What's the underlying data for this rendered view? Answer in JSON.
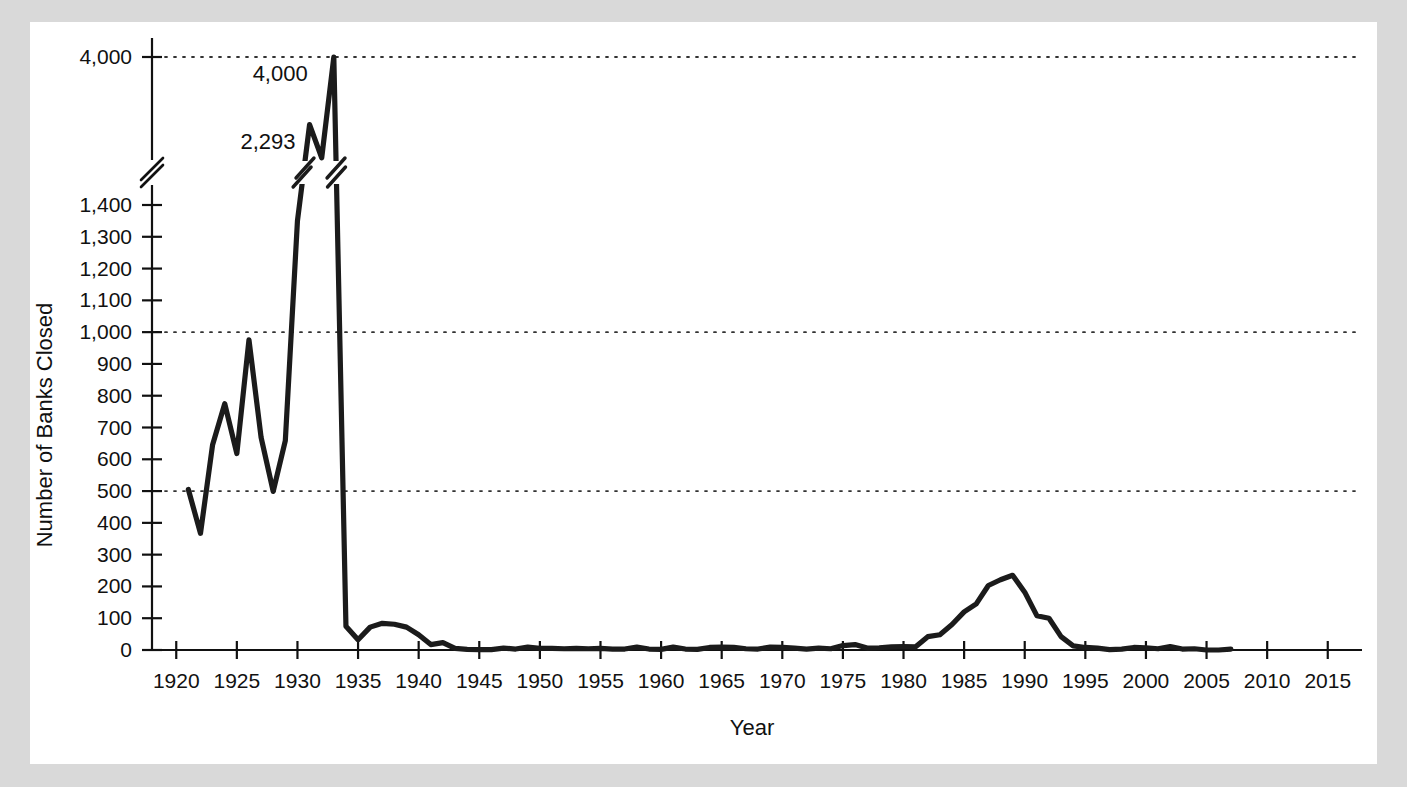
{
  "figure": {
    "background_color": "#d9d9d9",
    "panel_color": "#ffffff",
    "line_color": "#1b1b1b"
  },
  "chart_data": {
    "type": "line",
    "title": "",
    "xlabel": "Year",
    "ylabel": "Number of Banks Closed",
    "xlim": [
      1918,
      2017
    ],
    "ylim": [
      0,
      1400
    ],
    "grid": true,
    "gridlines": [
      500,
      1000,
      4000
    ],
    "legend": "none",
    "broken_axis": {
      "present": true,
      "lower_max": 1400,
      "upper_value": 4000,
      "note": "y-axis break between 1,400 and 4,000"
    },
    "ytick_labels": [
      "0",
      "100",
      "200",
      "300",
      "400",
      "500",
      "600",
      "700",
      "800",
      "900",
      "1,000",
      "1,100",
      "1,200",
      "1,300",
      "1,400",
      "4,000"
    ],
    "ytick_values": [
      0,
      100,
      200,
      300,
      400,
      500,
      600,
      700,
      800,
      900,
      1000,
      1100,
      1200,
      1300,
      1400,
      4000
    ],
    "xtick_labels": [
      "1920",
      "1925",
      "1930",
      "1935",
      "1940",
      "1945",
      "1950",
      "1955",
      "1960",
      "1965",
      "1970",
      "1975",
      "1980",
      "1985",
      "1990",
      "1995",
      "2000",
      "2005",
      "2010",
      "2015"
    ],
    "xtick_values": [
      1920,
      1925,
      1930,
      1935,
      1940,
      1945,
      1950,
      1955,
      1960,
      1965,
      1970,
      1975,
      1980,
      1985,
      1990,
      1995,
      2000,
      2005,
      2010,
      2015
    ],
    "annotations": [
      {
        "label": "4,000",
        "year": 1932,
        "value": 4000
      },
      {
        "label": "2,293",
        "year": 1931,
        "value": 2293
      }
    ],
    "x": [
      1921,
      1922,
      1923,
      1924,
      1925,
      1926,
      1927,
      1928,
      1929,
      1930,
      1931,
      1932,
      1933,
      1934,
      1935,
      1936,
      1937,
      1938,
      1939,
      1940,
      1941,
      1942,
      1943,
      1944,
      1945,
      1946,
      1947,
      1948,
      1949,
      1950,
      1951,
      1952,
      1953,
      1954,
      1955,
      1956,
      1957,
      1958,
      1959,
      1960,
      1961,
      1962,
      1963,
      1964,
      1965,
      1966,
      1967,
      1968,
      1969,
      1970,
      1971,
      1972,
      1973,
      1974,
      1975,
      1976,
      1977,
      1978,
      1979,
      1980,
      1981,
      1982,
      1983,
      1984,
      1985,
      1986,
      1987,
      1988,
      1989,
      1990,
      1991,
      1992,
      1993,
      1994,
      1995,
      1996,
      1997,
      1998,
      1999,
      2000,
      2001,
      2002,
      2003,
      2004,
      2005,
      2006,
      2007
    ],
    "values": [
      505,
      367,
      646,
      775,
      618,
      976,
      669,
      499,
      659,
      1350,
      2293,
      1453,
      4000,
      75,
      32,
      72,
      84,
      81,
      72,
      48,
      17,
      23,
      5,
      2,
      1,
      1,
      6,
      3,
      9,
      5,
      5,
      4,
      5,
      4,
      5,
      3,
      3,
      9,
      3,
      2,
      9,
      3,
      2,
      8,
      9,
      8,
      4,
      3,
      9,
      8,
      6,
      3,
      6,
      4,
      14,
      17,
      6,
      7,
      10,
      11,
      10,
      42,
      48,
      80,
      120,
      145,
      203,
      221,
      235,
      182,
      108,
      100,
      42,
      13,
      8,
      6,
      1,
      3,
      8,
      7,
      4,
      11,
      3,
      4,
      0,
      0,
      3
    ]
  }
}
